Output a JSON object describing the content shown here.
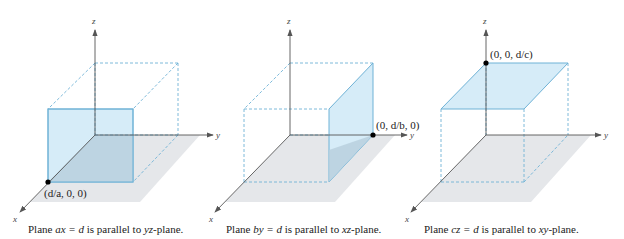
{
  "colors": {
    "plane_fill": "#d6ecf8",
    "plane_edge": "#6fb2d6",
    "overlap_fill": "#b9d0de",
    "floor_fill": "#e5e7ea",
    "axis": "#555555",
    "dashed": "#6fb2d6",
    "point": "#000000"
  },
  "panels": [
    {
      "id": "ax-plane",
      "axes": {
        "x": "x",
        "y": "y",
        "z": "z"
      },
      "point_label": "(d/a, 0, 0)",
      "caption": {
        "prefix": "Plane ",
        "equation": "ax = d",
        "middle": " is parallel to ",
        "plane": "yz",
        "suffix": "-plane."
      }
    },
    {
      "id": "by-plane",
      "axes": {
        "x": "x",
        "y": "y",
        "z": "z"
      },
      "point_label": "(0, d/b, 0)",
      "caption": {
        "prefix": "Plane ",
        "equation": "by = d",
        "middle": " is parallel to ",
        "plane": "xz",
        "suffix": "-plane."
      }
    },
    {
      "id": "cz-plane",
      "axes": {
        "x": "x",
        "y": "y",
        "z": "z"
      },
      "point_label": "(0, 0, d/c)",
      "caption": {
        "prefix": "Plane ",
        "equation": "cz = d",
        "middle": " is parallel to ",
        "plane": "xy",
        "suffix": "-plane."
      }
    }
  ]
}
